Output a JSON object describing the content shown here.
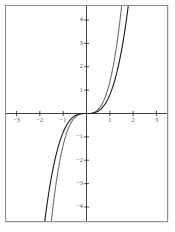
{
  "figure": {
    "background_color": "#ffffff",
    "border_color": "#8e8e8e"
  },
  "chart_data": {
    "type": "line",
    "title": "",
    "subtitle": "",
    "xlabel": "",
    "ylabel": "",
    "xlim": [
      -3.45,
      3.45
    ],
    "ylim": [
      -4.6,
      4.6
    ],
    "grid": false,
    "legend": null,
    "axis_color": "#2b2b2b",
    "xticks": [
      -3,
      -2,
      -1,
      1,
      2,
      3
    ],
    "xtick_labels": [
      "−3",
      "−2",
      "−1",
      "1",
      "2",
      "3"
    ],
    "yticks": [
      4,
      3,
      2,
      1,
      -1,
      -2,
      -3,
      -4
    ],
    "ytick_labels": [
      "4",
      "3",
      "2",
      "1",
      "−1",
      "−2",
      "−3",
      "−4"
    ],
    "series": [
      {
        "name": "steep-cubic-curve",
        "color": "#6f6f6f",
        "width": 1.1,
        "points_x": [
          -1.52,
          -1.45,
          -1.38,
          -1.3,
          -1.22,
          -1.14,
          -1.06,
          -0.98,
          -0.9,
          -0.82,
          -0.74,
          -0.66,
          -0.58,
          -0.5,
          -0.42,
          -0.34,
          -0.26,
          -0.18,
          -0.1,
          0,
          0.1,
          0.18,
          0.26,
          0.34,
          0.42,
          0.5,
          0.58,
          0.66,
          0.74,
          0.82,
          0.9,
          0.98,
          1.06,
          1.14,
          1.22,
          1.3,
          1.38,
          1.45,
          1.52
        ],
        "points_y": [
          -4.73,
          -4.11,
          -3.54,
          -2.96,
          -2.45,
          -2.0,
          -1.61,
          -1.27,
          -0.99,
          -0.74,
          -0.55,
          -0.39,
          -0.26,
          -0.17,
          -0.1,
          -0.05,
          -0.023,
          -0.008,
          -0.001,
          0,
          0.001,
          0.008,
          0.023,
          0.05,
          0.1,
          0.17,
          0.26,
          0.39,
          0.55,
          0.74,
          0.99,
          1.27,
          1.61,
          2.0,
          2.45,
          2.96,
          3.54,
          4.11,
          4.73
        ]
      },
      {
        "name": "shallow-cubic-curve",
        "color": "#1b1b1b",
        "width": 1.1,
        "points_x": [
          -1.82,
          -1.72,
          -1.62,
          -1.52,
          -1.42,
          -1.32,
          -1.22,
          -1.12,
          -1.02,
          -0.92,
          -0.82,
          -0.72,
          -0.62,
          -0.52,
          -0.42,
          -0.32,
          -0.22,
          -0.12,
          0,
          0.12,
          0.22,
          0.32,
          0.42,
          0.52,
          0.62,
          0.72,
          0.82,
          0.92,
          1.02,
          1.12,
          1.22,
          1.32,
          1.42,
          1.52,
          1.62,
          1.72,
          1.82
        ],
        "points_y": [
          -4.84,
          -4.08,
          -3.4,
          -2.8,
          -2.28,
          -1.83,
          -1.45,
          -1.12,
          -0.85,
          -0.62,
          -0.44,
          -0.3,
          -0.19,
          -0.11,
          -0.06,
          -0.027,
          -0.009,
          -0.0015,
          0,
          0.0015,
          0.009,
          0.027,
          0.06,
          0.11,
          0.19,
          0.3,
          0.44,
          0.62,
          0.85,
          1.12,
          1.45,
          1.83,
          2.28,
          2.8,
          3.4,
          4.08,
          4.84
        ]
      }
    ]
  }
}
